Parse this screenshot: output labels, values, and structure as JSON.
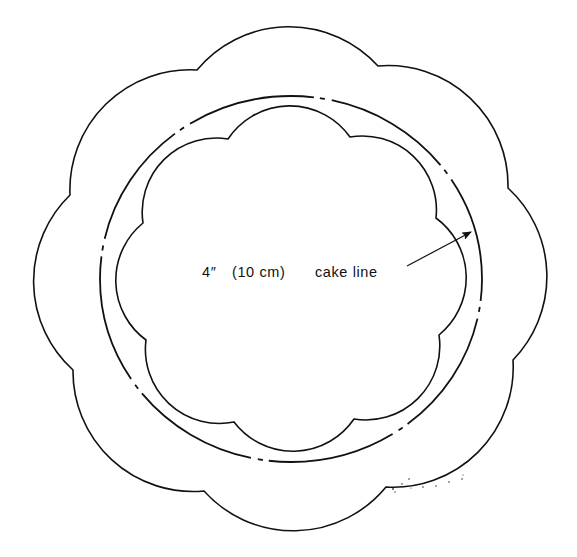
{
  "diagram": {
    "type": "cake-board-template",
    "colors": {
      "stroke": "#111111",
      "background": "#ffffff"
    },
    "outer_scallop": {
      "scallop_count": 8,
      "radius": 120,
      "cusps": [
        [
          197,
          70
        ],
        [
          378,
          66
        ],
        [
          508,
          188
        ],
        [
          513,
          360
        ],
        [
          386,
          487
        ],
        [
          204,
          491
        ],
        [
          73,
          370
        ],
        [
          70,
          195
        ]
      ]
    },
    "cake_line_circle": {
      "cx": 291,
      "cy": 279,
      "rx": 191,
      "ry": 183,
      "style": "dash-dot",
      "dasharray": "129 6 5 7"
    },
    "inner_scallop": {
      "scallop_count": 8,
      "radius": 74,
      "cusps": [
        [
          228,
          139
        ],
        [
          350,
          137
        ],
        [
          436,
          218
        ],
        [
          439,
          335
        ],
        [
          354,
          419
        ],
        [
          234,
          422
        ],
        [
          146,
          340
        ],
        [
          143,
          223
        ]
      ]
    },
    "annotation": {
      "size_label": "4″",
      "metric_label": "(10 cm)",
      "callout_label": "cake line",
      "arrow": {
        "from": [
          407,
          266
        ],
        "to": [
          471,
          232
        ]
      }
    }
  }
}
